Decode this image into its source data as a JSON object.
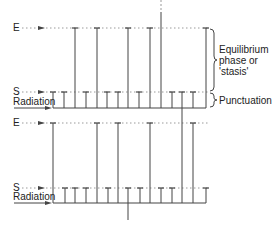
{
  "diagram": {
    "colors": {
      "line": "#444444",
      "dotted": "#9a9a9a",
      "text": "#222222",
      "background": "#ffffff"
    },
    "labels": {
      "E": "E",
      "S": "S",
      "radiation": "Radiation",
      "equilibrium_line1": "Equilibrium",
      "equilibrium_line2": "phase or",
      "equilibrium_line3": "'stasis'",
      "punctuation": "Punctuation"
    },
    "panels": [
      {
        "name": "top",
        "e_y": 28,
        "s_y": 92,
        "base_y": 108,
        "base_x_start": 53,
        "base_x_end": 206,
        "branches": [
          {
            "x": 53,
            "level": "S"
          },
          {
            "x": 64,
            "level": "S"
          },
          {
            "x": 75,
            "level": "E"
          },
          {
            "x": 86,
            "level": "S"
          },
          {
            "x": 97,
            "level": "E"
          },
          {
            "x": 107,
            "level": "S"
          },
          {
            "x": 118,
            "level": "S"
          },
          {
            "x": 128,
            "level": "E"
          },
          {
            "x": 139,
            "level": "S"
          },
          {
            "x": 150,
            "level": "E"
          },
          {
            "x": 161,
            "level": "top"
          },
          {
            "x": 172,
            "level": "S"
          },
          {
            "x": 182,
            "level": "S"
          },
          {
            "x": 193,
            "level": "S"
          },
          {
            "x": 206,
            "level": "E"
          }
        ]
      },
      {
        "name": "bottom",
        "e_y": 123,
        "s_y": 188,
        "base_y": 203,
        "base_x_start": 53,
        "base_x_end": 206,
        "branches": [
          {
            "x": 53,
            "level": "E"
          },
          {
            "x": 65,
            "level": "S"
          },
          {
            "x": 75,
            "level": "S"
          },
          {
            "x": 86,
            "level": "S"
          },
          {
            "x": 97,
            "level": "E"
          },
          {
            "x": 108,
            "level": "S"
          },
          {
            "x": 118,
            "level": "E"
          },
          {
            "x": 128,
            "level": "S"
          },
          {
            "x": 140,
            "level": "S"
          },
          {
            "x": 150,
            "level": "E"
          },
          {
            "x": 161,
            "level": "S"
          },
          {
            "x": 172,
            "level": "S"
          },
          {
            "x": 182,
            "level": "connector"
          },
          {
            "x": 193,
            "level": "E"
          },
          {
            "x": 206,
            "level": "S"
          }
        ]
      }
    ]
  }
}
